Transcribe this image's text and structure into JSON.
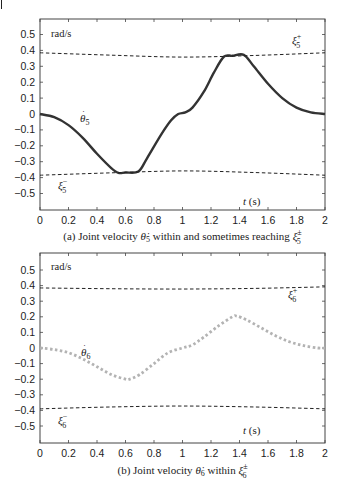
{
  "chart_data": [
    {
      "type": "line",
      "panel": "a",
      "caption": "(a) Joint velocity θ̇5 within and sometimes reaching ξ5±",
      "caption_parts": {
        "prefix": "(a) Joint velocity ",
        "var": "θ̇",
        "var_sub": "5",
        "middle": " within and sometimes reaching ",
        "bound": "ξ",
        "bound_sup": "±",
        "bound_sub": "5"
      },
      "ylabel": "rad/s",
      "xlabel": "t (s)",
      "xlim": [
        0,
        2
      ],
      "ylim": [
        -0.6,
        0.6
      ],
      "xticks": [
        "0",
        "0.2",
        "0.4",
        "0.6",
        "0.8",
        "1",
        "1.2",
        "1.4",
        "1.6",
        "1.8",
        "2"
      ],
      "yticks": [
        "0.5",
        "0.4",
        "0.3",
        "0.2",
        "0.1",
        "0",
        "−0.1",
        "−0.2",
        "−0.3",
        "−0.4",
        "−0.5"
      ],
      "grid": false,
      "series": [
        {
          "name": "θ̇5",
          "style": "solid",
          "color": "#333333",
          "x": [
            0,
            0.1,
            0.2,
            0.3,
            0.4,
            0.5,
            0.55,
            0.6,
            0.69,
            0.75,
            0.85,
            0.92,
            0.97,
            1.02,
            1.07,
            1.15,
            1.22,
            1.29,
            1.35,
            1.43,
            1.5,
            1.6,
            1.7,
            1.8,
            1.9,
            2.0
          ],
          "values": [
            0,
            -0.02,
            -0.07,
            -0.15,
            -0.25,
            -0.34,
            -0.37,
            -0.368,
            -0.362,
            -0.28,
            -0.13,
            -0.04,
            0.0,
            0.01,
            0.04,
            0.14,
            0.26,
            0.36,
            0.366,
            0.372,
            0.3,
            0.19,
            0.1,
            0.04,
            0.01,
            0.0
          ]
        },
        {
          "name": "ξ5+",
          "style": "dashed",
          "color": "#222222",
          "x": [
            0,
            0.5,
            1.0,
            1.5,
            2.0
          ],
          "values": [
            0.385,
            0.37,
            0.358,
            0.368,
            0.385
          ]
        },
        {
          "name": "ξ5−",
          "style": "dashed",
          "color": "#222222",
          "x": [
            0,
            0.5,
            1.0,
            1.5,
            2.0
          ],
          "values": [
            -0.385,
            -0.37,
            -0.358,
            -0.368,
            -0.385
          ]
        }
      ],
      "annotations": [
        {
          "text": "θ̇5",
          "x": 0.3,
          "y": -0.03
        },
        {
          "text": "ξ5+",
          "x": 1.85,
          "y": 0.45
        },
        {
          "text": "ξ5−",
          "x": 0.1,
          "y": -0.43
        },
        {
          "text": "t (s)",
          "x": 1.4,
          "y": -0.52
        },
        {
          "text": "rad/s",
          "x": 0.1,
          "y": 0.52
        }
      ]
    },
    {
      "type": "line",
      "panel": "b",
      "caption": "(b) Joint velocity θ̇6 within ξ6±",
      "caption_parts": {
        "prefix": "(b) Joint velocity ",
        "var": "θ̇",
        "var_sub": "6",
        "middle": " within ",
        "bound": "ξ",
        "bound_sup": "±",
        "bound_sub": "6"
      },
      "ylabel": "rad/s",
      "xlabel": "t (s)",
      "xlim": [
        0,
        2
      ],
      "ylim": [
        -0.6,
        0.6
      ],
      "xticks": [
        "0",
        "0.2",
        "0.4",
        "0.6",
        "0.8",
        "1",
        "1.2",
        "1.4",
        "1.6",
        "1.8",
        "2"
      ],
      "yticks": [
        "0.5",
        "0.4",
        "0.3",
        "0.2",
        "0.1",
        "0",
        "−0.1",
        "−0.2",
        "−0.3",
        "−0.4",
        "−0.5"
      ],
      "grid": false,
      "series": [
        {
          "name": "θ̇6",
          "style": "dotted",
          "color": "#b3b3b3",
          "x": [
            0,
            0.1,
            0.2,
            0.3,
            0.4,
            0.5,
            0.6,
            0.63,
            0.7,
            0.8,
            0.9,
            1.0,
            1.07,
            1.15,
            1.25,
            1.35,
            1.38,
            1.45,
            1.55,
            1.65,
            1.75,
            1.85,
            1.95,
            2.0
          ],
          "values": [
            0,
            -0.01,
            -0.03,
            -0.07,
            -0.12,
            -0.17,
            -0.2,
            -0.2,
            -0.17,
            -0.1,
            -0.03,
            0.0,
            0.02,
            0.07,
            0.14,
            0.2,
            0.205,
            0.18,
            0.13,
            0.08,
            0.04,
            0.015,
            0.0,
            0.0
          ]
        },
        {
          "name": "ξ6+",
          "style": "dashed",
          "color": "#222222",
          "x": [
            0,
            0.5,
            1.0,
            1.5,
            2.0
          ],
          "values": [
            0.385,
            0.38,
            0.378,
            0.382,
            0.392
          ]
        },
        {
          "name": "ξ6−",
          "style": "dashed",
          "color": "#222222",
          "x": [
            0,
            0.5,
            1.0,
            1.5,
            2.0
          ],
          "values": [
            -0.39,
            -0.378,
            -0.372,
            -0.378,
            -0.39
          ]
        }
      ],
      "annotations": [
        {
          "text": "θ̇6",
          "x": 0.3,
          "y": -0.03
        },
        {
          "text": "ξ6+",
          "x": 1.85,
          "y": 0.34
        },
        {
          "text": "ξ6−",
          "x": 0.1,
          "y": -0.45
        },
        {
          "text": "t (s)",
          "x": 1.4,
          "y": -0.53
        },
        {
          "text": "rad/s",
          "x": 0.1,
          "y": 0.52
        }
      ]
    }
  ]
}
